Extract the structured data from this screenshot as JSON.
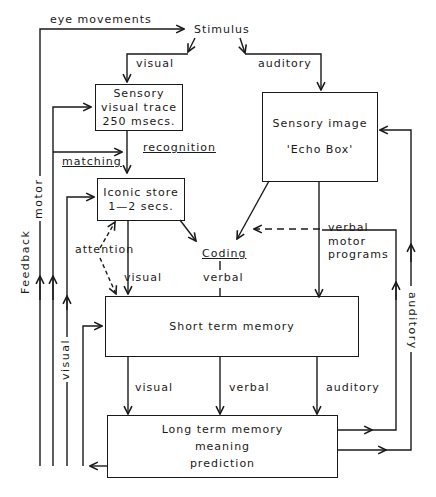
{
  "diagram": {
    "stimulus": "Stimulus",
    "boxes": {
      "sensory_visual": [
        "Sensory",
        "visual trace",
        "250 msecs."
      ],
      "sensory_image": [
        "Sensory image",
        "'Echo Box'"
      ],
      "iconic_store": [
        "Iconic store",
        "1—2 secs."
      ],
      "short_term": [
        "Short term memory"
      ],
      "long_term": [
        "Long term memory",
        "meaning",
        "prediction"
      ]
    },
    "labels": {
      "eye_movements": "eye movements",
      "visual_top": "visual",
      "auditory_top": "auditory",
      "recognition": "recognition",
      "matching": "matching",
      "attention": "attention",
      "visual_iconic_stm": "visual",
      "coding": "Coding",
      "verbal_coding": "verbal",
      "verbal_motor": "verbal",
      "motor_programs_1": "motor",
      "motor_programs_2": "programs",
      "visual_stm_ltm": "visual",
      "verbal_stm_ltm": "verbal",
      "auditory_stm_ltm": "auditory",
      "feedback": "Feedback",
      "motor_left": "motor",
      "visual_left": "visual",
      "auditory_right": "auditory"
    },
    "line_color": "#1a1a1a"
  }
}
